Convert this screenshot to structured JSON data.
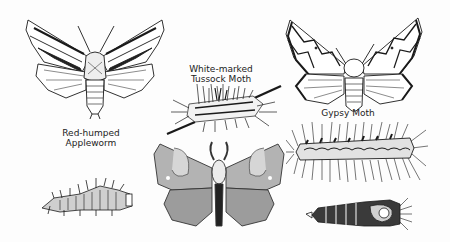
{
  "plate": {
    "background": "#ffffff",
    "ink": "#1a1a1a"
  },
  "labels": {
    "tussock": [
      "White-marked",
      "Tussock Moth"
    ],
    "gypsy": "Gypsy Moth",
    "appleworm": [
      "Red-humped",
      "Appleworm"
    ]
  },
  "figures": [
    {
      "name": "red-humped-appleworm-moth",
      "kind": "moth"
    },
    {
      "name": "white-marked-tussock-caterpillar",
      "kind": "caterpillar"
    },
    {
      "name": "gypsy-moth",
      "kind": "moth"
    },
    {
      "name": "red-humped-appleworm-caterpillar",
      "kind": "caterpillar"
    },
    {
      "name": "tussock-moth-adult",
      "kind": "moth"
    },
    {
      "name": "gypsy-moth-caterpillar",
      "kind": "caterpillar"
    },
    {
      "name": "gypsy-moth-pupa",
      "kind": "pupa"
    }
  ]
}
